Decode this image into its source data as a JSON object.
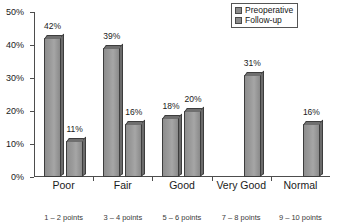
{
  "chart_data": {
    "type": "bar",
    "title": "",
    "xlabel": "",
    "ylabel": "",
    "ylim": [
      0,
      50
    ],
    "ytick_labels": [
      "0%",
      "10%",
      "20%",
      "30%",
      "40%",
      "50%"
    ],
    "ytick_values": [
      0,
      10,
      20,
      30,
      40,
      50
    ],
    "grid": false,
    "legend_position": "top-right",
    "categories": [
      "Poor",
      "Fair",
      "Good",
      "Very Good",
      "Normal"
    ],
    "category_sublabels": [
      "1 – 2 points",
      "3 – 4 points",
      "5 – 6 points",
      "7 – 8 points",
      "9 – 10 points"
    ],
    "series": [
      {
        "name": "Preoperative",
        "values": [
          42,
          39,
          18,
          null,
          null
        ],
        "labels": [
          "42%",
          "39%",
          "18%",
          "",
          ""
        ]
      },
      {
        "name": "Follow-up",
        "values": [
          11,
          16,
          20,
          31,
          16
        ],
        "labels": [
          "11%",
          "16%",
          "20%",
          "31%",
          "16%"
        ]
      }
    ]
  },
  "legend": {
    "items": [
      {
        "label": "Preoperative",
        "swatch_color": "#8c8c8c"
      },
      {
        "label": "Follow-up",
        "swatch_color": "#8c8c8c"
      }
    ]
  },
  "colors": {
    "bar_fill": "#9a9a9a",
    "bar_edge": "#3d3d3d",
    "bar_top_face": "#6f6f6f",
    "axis": "#4d4d4d",
    "text": "#1a1a1a",
    "background": "#ffffff"
  }
}
